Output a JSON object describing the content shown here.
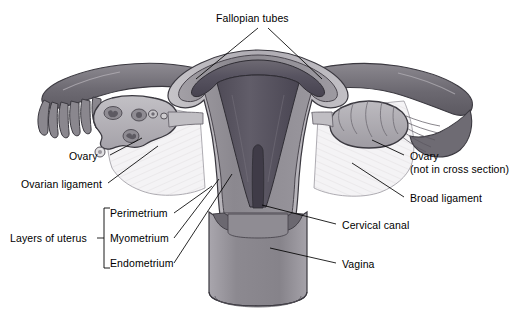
{
  "figure": {
    "kind": "anatomical-diagram",
    "background_color": "#ffffff",
    "line_color": "#000000",
    "palette": {
      "endometrium_dark": "#55515a",
      "myometrium_mid": "#8e8b91",
      "perimetrium_light": "#b9b7bc",
      "broad_ligament": "#f2f1f3",
      "ovary_fill": "#b3b1b6",
      "tube_fill": "#78757c",
      "vagina_fill": "#908d94",
      "outline": "#3b3940"
    }
  },
  "labels": {
    "fallopian_tubes": "Fallopian tubes",
    "ovary_left": "Ovary",
    "ovarian_ligament": "Ovarian ligament",
    "layers_of_uterus": "Layers of uterus",
    "perimetrium": "Perimetrium",
    "myometrium": "Myometrium",
    "endometrium": "Endometrium",
    "ovary_right_line1": "Ovary",
    "ovary_right_line2": "(not in cross section)",
    "broad_ligament": "Broad ligament",
    "cervical_canal": "Cervical canal",
    "vagina": "Vagina"
  }
}
